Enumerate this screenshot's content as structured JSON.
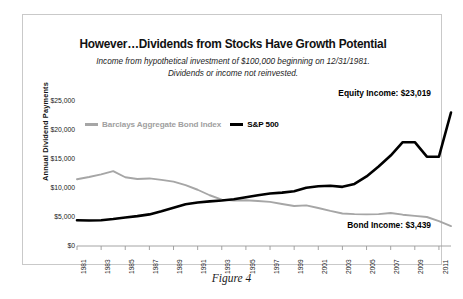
{
  "figure": {
    "caption": "Figure 4"
  },
  "header": {
    "title": "However…Dividends from Stocks Have Growth Potential",
    "subtitle_line1": "Income from hypothetical investment of $100,000 beginning on 12/31/1981.",
    "subtitle_line2": "Dividends or income not reinvested."
  },
  "legend": {
    "bond_label": "Barclays Aggregate Bond Index",
    "equity_label": "S&P 500"
  },
  "annotations": {
    "equity": "Equity Income: $23,019",
    "bond": "Bond Income: $3,439"
  },
  "colors": {
    "equity_line": "#000000",
    "bond_line": "#a6a6a6",
    "axis": "#9a9a9a",
    "panel_border": "#c9c9c9",
    "text": "#111111"
  },
  "chart_data": {
    "type": "line",
    "title": "However…Dividends from Stocks Have Growth Potential",
    "subtitle": "Income from hypothetical investment of $100,000 beginning on 12/31/1981. Dividends or income not reinvested.",
    "xlabel": "",
    "ylabel": "Annual Dividend Payments",
    "ylim": [
      0,
      25000
    ],
    "xlim": [
      1981,
      2012
    ],
    "ytick_labels": [
      "$0",
      "$5,000",
      "$10,000",
      "$15,000",
      "$20,000",
      "$25,000"
    ],
    "ytick_values": [
      0,
      5000,
      10000,
      15000,
      20000,
      25000
    ],
    "xtick_labels": [
      "1981",
      "1983",
      "1985",
      "1987",
      "1989",
      "1991",
      "1993",
      "1995",
      "1997",
      "1999",
      "2001",
      "2003",
      "2005",
      "2007",
      "2009",
      "2011"
    ],
    "xtick_values": [
      1981,
      1983,
      1985,
      1987,
      1989,
      1991,
      1993,
      1995,
      1997,
      1999,
      2001,
      2003,
      2005,
      2007,
      2009,
      2011
    ],
    "grid": false,
    "legend_position": "top-left",
    "x": [
      1981,
      1982,
      1983,
      1984,
      1985,
      1986,
      1987,
      1988,
      1989,
      1990,
      1991,
      1992,
      1993,
      1994,
      1995,
      1996,
      1997,
      1998,
      1999,
      2000,
      2001,
      2002,
      2003,
      2004,
      2005,
      2006,
      2007,
      2008,
      2009,
      2010,
      2011,
      2012
    ],
    "series": [
      {
        "name": "Barclays Aggregate Bond Index",
        "color": "#a6a6a6",
        "final_value": 3439,
        "values": [
          11500,
          11900,
          12350,
          12900,
          11850,
          11550,
          11650,
          11400,
          11100,
          10500,
          9700,
          8750,
          8000,
          7850,
          7900,
          7750,
          7600,
          7250,
          6900,
          7000,
          6550,
          6050,
          5600,
          5500,
          5450,
          5500,
          5700,
          5400,
          5200,
          5000,
          4300,
          3439
        ]
      },
      {
        "name": "S&P 500",
        "color": "#000000",
        "final_value": 23019,
        "values": [
          4450,
          4400,
          4450,
          4650,
          4900,
          5150,
          5450,
          6000,
          6600,
          7200,
          7500,
          7700,
          7850,
          8050,
          8400,
          8750,
          9050,
          9200,
          9450,
          10050,
          10300,
          10400,
          10200,
          10700,
          12000,
          13700,
          15600,
          17900,
          17900,
          15400,
          15400,
          23019
        ]
      }
    ]
  }
}
